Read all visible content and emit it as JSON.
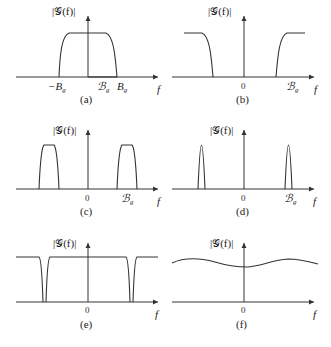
{
  "figure": {
    "y_label": "|G(f)|",
    "x_label": "f",
    "zero_label": "0",
    "panels": [
      {
        "id": "a",
        "caption": "(a)",
        "tick_labels": [
          "-Bg",
          "Bg",
          "Bg"
        ],
        "description": "lowpass spectrum, flat from -Bg to Bg"
      },
      {
        "id": "b",
        "caption": "(b)",
        "tick_labels": [
          "0",
          "Bg"
        ],
        "description": "highpass spectrum, zero in the middle band"
      },
      {
        "id": "c",
        "caption": "(c)",
        "tick_labels": [
          "0",
          "Bg"
        ],
        "description": "bandpass spectrum, two wide pulses"
      },
      {
        "id": "d",
        "caption": "(d)",
        "tick_labels": [
          "0",
          "Bg"
        ],
        "description": "narrowband bandpass spectrum, two narrow pulses"
      },
      {
        "id": "e",
        "caption": "(e)",
        "tick_labels": [
          "0"
        ],
        "description": "notch (bandstop) spectrum, two narrow notches"
      },
      {
        "id": "f",
        "caption": "(f)",
        "tick_labels": [
          "0"
        ],
        "description": "broadband, nearly flat wavy spectrum"
      }
    ]
  },
  "labels": {
    "ylab": "|𝒢(f)|",
    "f": "f",
    "zero": "0",
    "neg_bg": "−B",
    "bg": "B",
    "bg_script": "ℬ",
    "sub_g": "g",
    "cap_a": "(a)",
    "cap_b": "(b)",
    "cap_c": "(c)",
    "cap_d": "(d)",
    "cap_e": "(e)",
    "cap_f": "(f)"
  },
  "colors": {
    "line": "#333333",
    "background": "#ffffff"
  }
}
